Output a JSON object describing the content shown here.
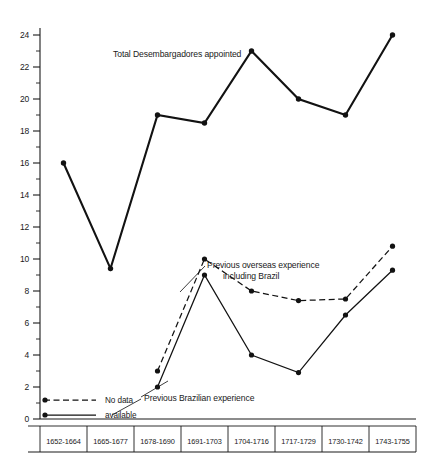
{
  "chart_data": {
    "type": "line",
    "title": "",
    "xlabel": "",
    "ylabel": "",
    "ylim": [
      0,
      24
    ],
    "y_tick_step": 2,
    "y_minor_step": 1,
    "grid": false,
    "legend_position": "bottom-left",
    "categories": [
      "1652-1664",
      "1665-1677",
      "1678-1690",
      "1691-1703",
      "1704-1716",
      "1717-1729",
      "1730-1742",
      "1743-1755"
    ],
    "y_ticks": [
      0,
      2,
      4,
      6,
      8,
      10,
      12,
      14,
      16,
      18,
      20,
      22,
      24
    ],
    "series": [
      {
        "name": "Total Desembargadores appointed",
        "style": "solid-thick",
        "values": [
          16,
          9.4,
          19,
          18.5,
          23,
          20,
          19,
          24
        ]
      },
      {
        "name": "Previous overseas experience including Brazil",
        "style": "dashed",
        "values": [
          null,
          null,
          3,
          10,
          8,
          7.4,
          7.5,
          10.8
        ]
      },
      {
        "name": "Previous Brazilian experience",
        "style": "solid-thin",
        "values": [
          null,
          null,
          2,
          9,
          4,
          2.9,
          6.5,
          9.3
        ]
      }
    ],
    "annotations": [
      {
        "id": "total",
        "text": "Total Desembargadores appointed"
      },
      {
        "id": "overseas_line1",
        "text": "Previous overseas experience"
      },
      {
        "id": "overseas_line2",
        "text": "including Brazil"
      },
      {
        "id": "brazil",
        "text": "Previous Brazilian experience"
      }
    ]
  },
  "legend": {
    "entries": [
      {
        "label": "No data",
        "style": "dashed"
      },
      {
        "label": "available",
        "style": "solid"
      }
    ]
  },
  "colors": {
    "ink": "#121212",
    "background": "#ffffff"
  }
}
